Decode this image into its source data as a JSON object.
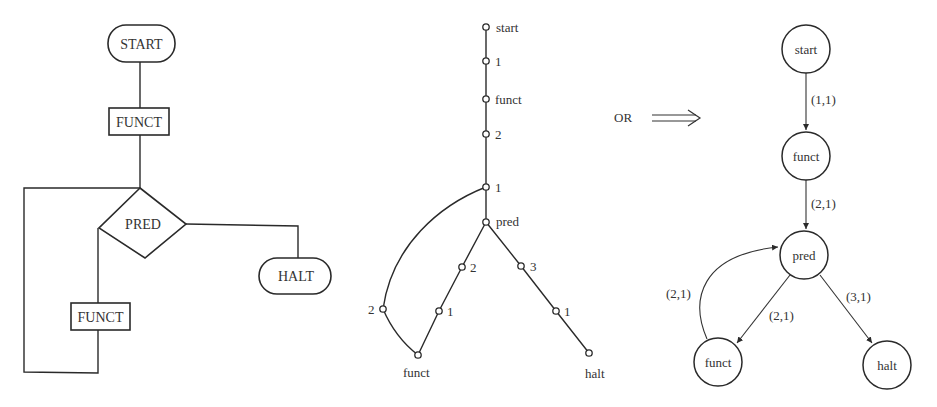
{
  "flowchart": {
    "start": "START",
    "funct_top": "FUNCT",
    "pred": "PRED",
    "halt": "HALT",
    "funct_bottom": "FUNCT"
  },
  "tree_graph": {
    "nodes": {
      "start": "start",
      "n1a": "1",
      "funct_mid": "funct",
      "n2a": "2",
      "n1b": "1",
      "pred": "pred",
      "left_2": "2",
      "left_1": "1",
      "funct_bottom": "funct",
      "right_3": "3",
      "right_1": "1",
      "halt": "halt",
      "curve_2": "2"
    }
  },
  "connector": {
    "label": "OR",
    "arrow": "⟹"
  },
  "state_graph": {
    "nodes": {
      "start": "start",
      "funct_top": "funct",
      "pred": "pred",
      "funct_bottom": "funct",
      "halt": "halt"
    },
    "edges": {
      "start_funct": "(1,1)",
      "funct_pred": "(2,1)",
      "funct_pred_loop": "(2,1)",
      "pred_funct": "(2,1)",
      "pred_halt": "(3,1)"
    }
  }
}
